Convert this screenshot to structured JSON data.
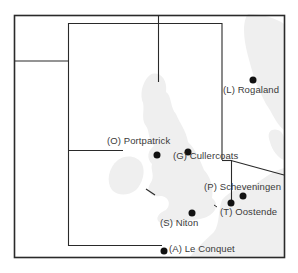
{
  "map": {
    "type": "station-coverage-map",
    "colors": {
      "frame": "#2a2a2a",
      "land": "#ececec",
      "dot": "#111111",
      "label": "#3a3a3a"
    },
    "stations": [
      {
        "code": "L",
        "name": "Rogaland",
        "label": "(L) Rogaland"
      },
      {
        "code": "O",
        "name": "Portpatrick",
        "label": "(O) Portpatrick"
      },
      {
        "code": "G",
        "name": "Cullercoats",
        "label": "(G) Cullercoats"
      },
      {
        "code": "P",
        "name": "Scheveningen",
        "label": "(P) Scheveningen"
      },
      {
        "code": "T",
        "name": "Oostende",
        "label": "(T) Oostende"
      },
      {
        "code": "S",
        "name": "Niton",
        "label": "(S) Niton"
      },
      {
        "code": "A",
        "name": "Le Conquet",
        "label": "(A) Le Conquet"
      }
    ]
  }
}
